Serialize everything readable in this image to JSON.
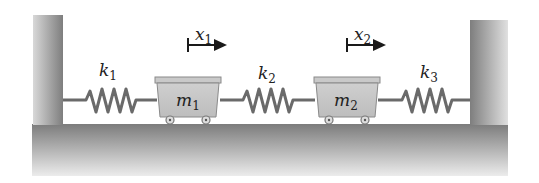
{
  "diagram": {
    "type": "two-mass three-spring system",
    "springs": [
      {
        "id": "k1",
        "label": "k",
        "subscript": "1"
      },
      {
        "id": "k2",
        "label": "k",
        "subscript": "2"
      },
      {
        "id": "k3",
        "label": "k",
        "subscript": "3"
      }
    ],
    "masses": [
      {
        "id": "m1",
        "label": "m",
        "subscript": "1"
      },
      {
        "id": "m2",
        "label": "m",
        "subscript": "2"
      }
    ],
    "displacements": [
      {
        "id": "x1",
        "label": "x",
        "subscript": "1"
      },
      {
        "id": "x2",
        "label": "x",
        "subscript": "2"
      }
    ],
    "colors": {
      "wall": "#8a8a8a",
      "floor_top": "#7a7a7a",
      "floor_bottom": "#e6e6e6",
      "cart": "#c4c4c4",
      "spring": "#666666",
      "arrow": "#1a1a1a"
    }
  }
}
